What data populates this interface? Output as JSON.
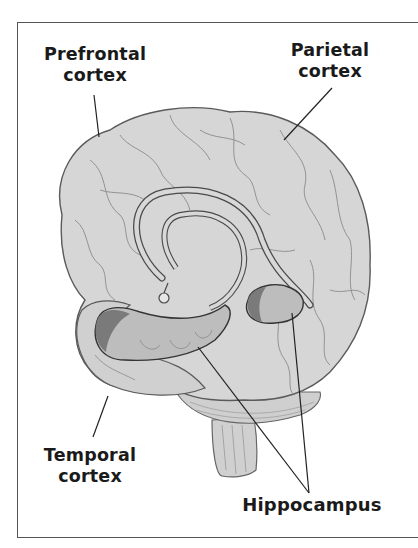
{
  "diagram": {
    "labels": {
      "prefrontal": {
        "line1": "Prefrontal",
        "line2": "cortex"
      },
      "parietal": {
        "line1": "Parietal",
        "line2": "cortex"
      },
      "temporal": {
        "line1": "Temporal",
        "line2": "cortex"
      },
      "hippocampus": {
        "text": "Hippocampus"
      }
    },
    "colors": {
      "brain_fill": "#d4d4d4",
      "sulci": "#8a8a8a",
      "outline": "#5a5a5a",
      "hippocampus_fill": "#bdbdbd",
      "hippocampus_shadow": "#7a7a7a",
      "leader_line": "#222222",
      "frame": "#555555"
    }
  }
}
